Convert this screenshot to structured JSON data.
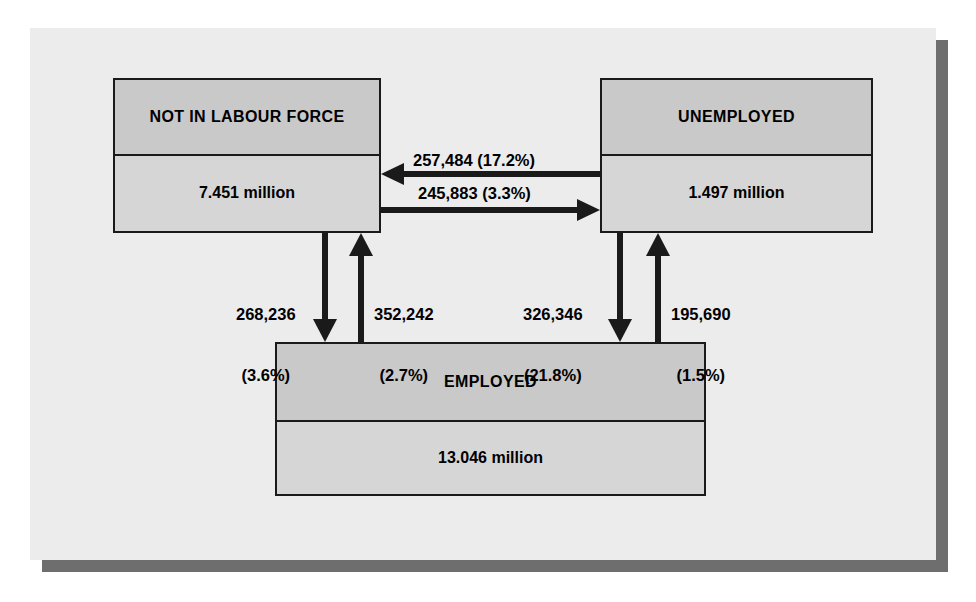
{
  "diagram": {
    "colors": {
      "panel_background": "#ececec",
      "panel_shadow": "#6e6e6e",
      "box_border": "#1a1a1a",
      "box_header_fill": "#c9c9c9",
      "box_value_fill": "#d6d6d6",
      "arrow": "#1a1a1a",
      "text": "#000000"
    },
    "nodes": [
      {
        "id": "not-in-labour-force",
        "title": "NOT IN LABOUR FORCE",
        "value": "7.451 million"
      },
      {
        "id": "unemployed",
        "title": "UNEMPLOYED",
        "value": "1.497 million"
      },
      {
        "id": "employed",
        "title": "EMPLOYED",
        "value": "13.046 million"
      }
    ],
    "flows": [
      {
        "id": "unemployed-to-not-in-labour-force",
        "from": "unemployed",
        "to": "not-in-labour-force",
        "direction": "left",
        "count": "257,484",
        "percent": "17.2%",
        "label": "257,484 (17.2%)"
      },
      {
        "id": "not-in-labour-force-to-unemployed",
        "from": "not-in-labour-force",
        "to": "unemployed",
        "direction": "right",
        "count": "245,883",
        "percent": "3.3%",
        "label": "245,883 (3.3%)"
      },
      {
        "id": "not-in-labour-force-to-employed",
        "from": "not-in-labour-force",
        "to": "employed",
        "direction": "down",
        "count": "268,236",
        "percent": "3.6%",
        "label_line1": "268,236",
        "label_line2": "(3.6%)"
      },
      {
        "id": "employed-to-not-in-labour-force",
        "from": "employed",
        "to": "not-in-labour-force",
        "direction": "up",
        "count": "352,242",
        "percent": "2.7%",
        "label_line1": "352,242",
        "label_line2": "(2.7%)"
      },
      {
        "id": "unemployed-to-employed",
        "from": "unemployed",
        "to": "employed",
        "direction": "down",
        "count": "326,346",
        "percent": "21.8%",
        "label_line1": "326,346",
        "label_line2": "(21.8%)"
      },
      {
        "id": "employed-to-unemployed",
        "from": "employed",
        "to": "unemployed",
        "direction": "up",
        "count": "195,690",
        "percent": "1.5%",
        "label_line1": "195,690",
        "label_line2": "(1.5%)"
      }
    ]
  }
}
